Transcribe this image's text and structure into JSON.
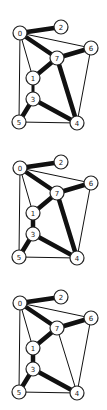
{
  "canvas": {
    "width": 107,
    "height": 410,
    "background": "#ffffff"
  },
  "node_radius": 7,
  "stroke_widths": {
    "thin": 1,
    "medium": 3,
    "thick": 4.5
  },
  "nodes": [
    {
      "id": "0",
      "x": 20,
      "y": 33
    },
    {
      "id": "1",
      "x": 33,
      "y": 78
    },
    {
      "id": "2",
      "x": 61,
      "y": 27
    },
    {
      "id": "3",
      "x": 33,
      "y": 99
    },
    {
      "id": "4",
      "x": 77,
      "y": 123
    },
    {
      "id": "5",
      "x": 19,
      "y": 122
    },
    {
      "id": "6",
      "x": 91,
      "y": 48
    },
    {
      "id": "7",
      "x": 57,
      "y": 58
    }
  ],
  "graphs": [
    {
      "name": "graph-1",
      "offset_y": 0,
      "edges": [
        {
          "from": "0",
          "to": "5",
          "weight": "thin"
        },
        {
          "from": "0",
          "to": "1",
          "weight": "thin"
        },
        {
          "from": "0",
          "to": "6",
          "weight": "thin"
        },
        {
          "from": "5",
          "to": "4",
          "weight": "thin"
        },
        {
          "from": "6",
          "to": "4",
          "weight": "thin"
        },
        {
          "from": "0",
          "to": "2",
          "weight": "thick"
        },
        {
          "from": "0",
          "to": "7",
          "weight": "thick"
        },
        {
          "from": "7",
          "to": "6",
          "weight": "thick"
        },
        {
          "from": "7",
          "to": "1",
          "weight": "thick"
        },
        {
          "from": "7",
          "to": "4",
          "weight": "thick"
        },
        {
          "from": "1",
          "to": "3",
          "weight": "medium"
        },
        {
          "from": "3",
          "to": "5",
          "weight": "thick"
        },
        {
          "from": "3",
          "to": "4",
          "weight": "thick"
        }
      ]
    },
    {
      "name": "graph-2",
      "offset_y": 135,
      "edges": [
        {
          "from": "0",
          "to": "5",
          "weight": "thin"
        },
        {
          "from": "0",
          "to": "1",
          "weight": "thin"
        },
        {
          "from": "0",
          "to": "6",
          "weight": "thin"
        },
        {
          "from": "5",
          "to": "4",
          "weight": "thin"
        },
        {
          "from": "6",
          "to": "4",
          "weight": "thin"
        },
        {
          "from": "0",
          "to": "2",
          "weight": "thick"
        },
        {
          "from": "0",
          "to": "7",
          "weight": "thick"
        },
        {
          "from": "7",
          "to": "6",
          "weight": "thick"
        },
        {
          "from": "7",
          "to": "1",
          "weight": "thick"
        },
        {
          "from": "7",
          "to": "4",
          "weight": "thick"
        },
        {
          "from": "1",
          "to": "3",
          "weight": "thick"
        },
        {
          "from": "3",
          "to": "5",
          "weight": "thick"
        },
        {
          "from": "3",
          "to": "4",
          "weight": "thick"
        }
      ]
    },
    {
      "name": "graph-3",
      "offset_y": 270,
      "edges": [
        {
          "from": "0",
          "to": "5",
          "weight": "thin"
        },
        {
          "from": "0",
          "to": "1",
          "weight": "thin"
        },
        {
          "from": "0",
          "to": "6",
          "weight": "thin"
        },
        {
          "from": "5",
          "to": "4",
          "weight": "thin"
        },
        {
          "from": "6",
          "to": "4",
          "weight": "thin"
        },
        {
          "from": "7",
          "to": "4",
          "weight": "thin"
        },
        {
          "from": "0",
          "to": "2",
          "weight": "thick"
        },
        {
          "from": "0",
          "to": "7",
          "weight": "thick"
        },
        {
          "from": "7",
          "to": "6",
          "weight": "thick"
        },
        {
          "from": "7",
          "to": "1",
          "weight": "thick"
        },
        {
          "from": "1",
          "to": "3",
          "weight": "thick"
        },
        {
          "from": "3",
          "to": "5",
          "weight": "thick"
        },
        {
          "from": "3",
          "to": "4",
          "weight": "thick"
        }
      ]
    }
  ]
}
